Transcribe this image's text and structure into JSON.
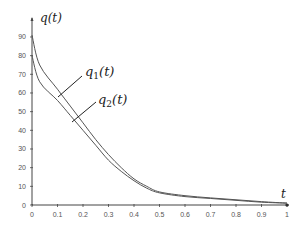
{
  "chart_data": {
    "type": "line",
    "title": "",
    "xlabel": "t",
    "ylabel": "q(t)",
    "xlim": [
      0,
      1
    ],
    "ylim": [
      0,
      95
    ],
    "x_ticks": [
      "0",
      "0.1",
      "0.2",
      "0.3",
      "0.4",
      "0.5",
      "0.6",
      "0.7",
      "0.8",
      "0.9",
      "1"
    ],
    "y_ticks": [
      "0",
      "10",
      "20",
      "30",
      "40",
      "50",
      "60",
      "70",
      "80",
      "90"
    ],
    "grid": false,
    "legend": "inline annotations",
    "x": [
      0,
      0.03,
      0.1,
      0.15,
      0.2,
      0.25,
      0.3,
      0.35,
      0.4,
      0.45,
      0.5,
      0.6,
      0.7,
      0.8,
      0.9,
      1.0
    ],
    "series": [
      {
        "name": "q1(t)",
        "values": [
          91,
          75,
          62,
          53,
          44,
          35,
          27,
          20,
          14,
          10,
          7,
          5,
          3.8,
          2.8,
          1.8,
          1
        ]
      },
      {
        "name": "q2(t)",
        "values": [
          80,
          66,
          56,
          48,
          40,
          32,
          24,
          18,
          13,
          9,
          6.5,
          4.5,
          3.5,
          2.5,
          1.5,
          1
        ]
      }
    ],
    "annotations": [
      {
        "label": "q1(t)",
        "text_main": "q",
        "text_sub": "1",
        "text_tail": "(t)"
      },
      {
        "label": "q2(t)",
        "text_main": "q",
        "text_sub": "2",
        "text_tail": "(t)"
      }
    ],
    "colors": {
      "line": "#555555",
      "axis": "#444444"
    }
  }
}
